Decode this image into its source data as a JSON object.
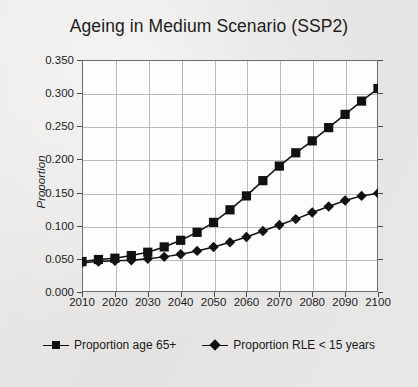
{
  "chart_data": {
    "type": "line",
    "title": "Ageing in Medium Scenario (SSP2)",
    "xlabel": "",
    "ylabel": "Proportion",
    "xlim": [
      2010,
      2100
    ],
    "ylim": [
      0.0,
      0.35
    ],
    "grid": true,
    "legend_position": "bottom",
    "x_ticks": [
      "2010",
      "2020",
      "2030",
      "2040",
      "2050",
      "2060",
      "2070",
      "2080",
      "2090",
      "2100"
    ],
    "y_ticks": [
      "0.000",
      "0.050",
      "0.100",
      "0.150",
      "0.200",
      "0.250",
      "0.300",
      "0.350"
    ],
    "x": [
      2010,
      2015,
      2020,
      2025,
      2030,
      2035,
      2040,
      2045,
      2050,
      2055,
      2060,
      2065,
      2070,
      2075,
      2080,
      2085,
      2090,
      2095,
      2100
    ],
    "series": [
      {
        "name": "Proportion age 65+",
        "marker": "square",
        "color": "#111111",
        "values": [
          0.046,
          0.049,
          0.051,
          0.055,
          0.06,
          0.068,
          0.078,
          0.09,
          0.105,
          0.124,
          0.145,
          0.168,
          0.19,
          0.21,
          0.228,
          0.248,
          0.268,
          0.288,
          0.307
        ]
      },
      {
        "name": "Proportion RLE < 15 years",
        "marker": "diamond",
        "color": "#111111",
        "values": [
          0.044,
          0.046,
          0.047,
          0.048,
          0.05,
          0.053,
          0.057,
          0.062,
          0.068,
          0.075,
          0.083,
          0.092,
          0.101,
          0.11,
          0.12,
          0.129,
          0.138,
          0.145,
          0.149
        ]
      }
    ]
  }
}
